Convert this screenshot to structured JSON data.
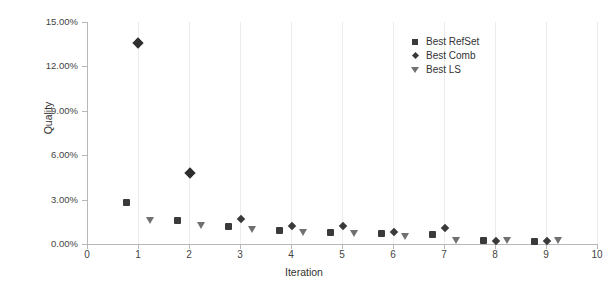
{
  "chart_data": {
    "type": "scatter",
    "title": "",
    "xlabel": "Iteration",
    "ylabel": "Quality",
    "xlim": [
      0,
      10
    ],
    "ylim": [
      0,
      15
    ],
    "grid": "vertical",
    "legend_position": "top-right",
    "y_tick_labels": [
      "0.00%",
      "3.00%",
      "6.00%",
      "9.00%",
      "12.00%",
      "15.00%"
    ],
    "y_tick_values": [
      0,
      3,
      6,
      9,
      12,
      15
    ],
    "x_tick_labels": [
      "0",
      "1",
      "2",
      "3",
      "4",
      "5",
      "6",
      "7",
      "8",
      "9",
      "10"
    ],
    "x_tick_values": [
      0,
      1,
      2,
      3,
      4,
      5,
      6,
      7,
      8,
      9,
      10
    ],
    "series": [
      {
        "name": "Best RefSet",
        "marker": "square",
        "color": "#3a3a3a",
        "points": [
          {
            "x": 0.77,
            "y": 2.78
          },
          {
            "x": 1.77,
            "y": 1.6
          },
          {
            "x": 2.77,
            "y": 1.2
          },
          {
            "x": 3.77,
            "y": 0.93
          },
          {
            "x": 4.77,
            "y": 0.8
          },
          {
            "x": 5.77,
            "y": 0.7
          },
          {
            "x": 6.77,
            "y": 0.62
          },
          {
            "x": 7.77,
            "y": 0.22
          },
          {
            "x": 8.77,
            "y": 0.2
          }
        ]
      },
      {
        "name": "Best Comb",
        "marker": "diamond",
        "color": "#3a3a3a",
        "points": [
          {
            "x": 1.0,
            "y": 13.55
          },
          {
            "x": 2.02,
            "y": 4.78
          },
          {
            "x": 3.02,
            "y": 1.72
          },
          {
            "x": 4.02,
            "y": 1.22
          },
          {
            "x": 5.02,
            "y": 1.2
          },
          {
            "x": 6.02,
            "y": 0.82
          },
          {
            "x": 7.02,
            "y": 1.1
          },
          {
            "x": 8.02,
            "y": 0.22
          },
          {
            "x": 9.02,
            "y": 0.22
          }
        ]
      },
      {
        "name": "Best LS",
        "marker": "triangle-down",
        "color": "#707070",
        "points": [
          {
            "x": 1.25,
            "y": 1.58
          },
          {
            "x": 2.25,
            "y": 1.22
          },
          {
            "x": 3.25,
            "y": 0.92
          },
          {
            "x": 4.25,
            "y": 0.75
          },
          {
            "x": 5.25,
            "y": 0.7
          },
          {
            "x": 6.25,
            "y": 0.5
          },
          {
            "x": 7.25,
            "y": 0.18
          },
          {
            "x": 8.25,
            "y": 0.18
          },
          {
            "x": 9.25,
            "y": 0.18
          }
        ]
      }
    ]
  },
  "legend": {
    "items": [
      {
        "label": "Best RefSet",
        "marker": "square"
      },
      {
        "label": "Best Comb",
        "marker": "diamond"
      },
      {
        "label": "Best LS",
        "marker": "triangle-down"
      }
    ]
  }
}
